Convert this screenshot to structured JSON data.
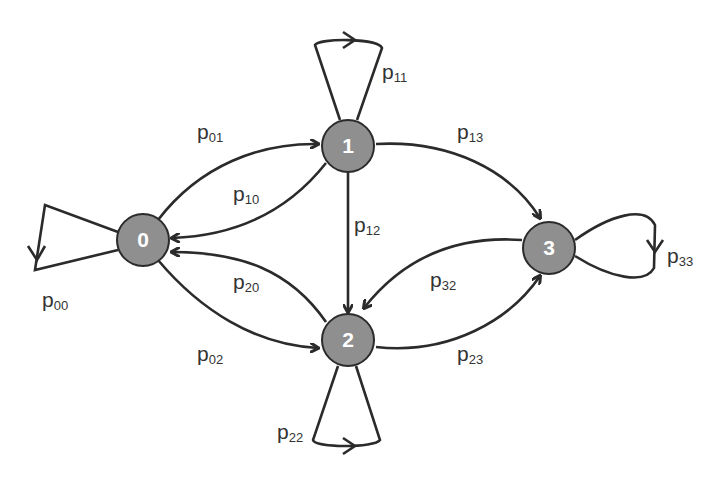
{
  "diagram": {
    "type": "markov-chain-state-graph",
    "colors": {
      "node_fill": "#8f8f8f",
      "node_stroke": "#2b2b2b",
      "edge": "#2b2b2b",
      "node_text": "#ffffff",
      "label_text": "#333333"
    },
    "nodes": [
      {
        "id": "0",
        "label": "0"
      },
      {
        "id": "1",
        "label": "1"
      },
      {
        "id": "2",
        "label": "2"
      },
      {
        "id": "3",
        "label": "3"
      }
    ],
    "edges": [
      {
        "from": "0",
        "to": "0",
        "label": "p",
        "sub": "00"
      },
      {
        "from": "0",
        "to": "1",
        "label": "p",
        "sub": "01"
      },
      {
        "from": "1",
        "to": "0",
        "label": "p",
        "sub": "10"
      },
      {
        "from": "1",
        "to": "1",
        "label": "p",
        "sub": "11"
      },
      {
        "from": "1",
        "to": "3",
        "label": "p",
        "sub": "13"
      },
      {
        "from": "1",
        "to": "2",
        "label": "p",
        "sub": "12"
      },
      {
        "from": "0",
        "to": "2",
        "label": "p",
        "sub": "02"
      },
      {
        "from": "2",
        "to": "0",
        "label": "p",
        "sub": "20"
      },
      {
        "from": "2",
        "to": "2",
        "label": "p",
        "sub": "22"
      },
      {
        "from": "2",
        "to": "3",
        "label": "p",
        "sub": "23"
      },
      {
        "from": "3",
        "to": "2",
        "label": "p",
        "sub": "32"
      },
      {
        "from": "3",
        "to": "3",
        "label": "p",
        "sub": "33"
      }
    ]
  }
}
